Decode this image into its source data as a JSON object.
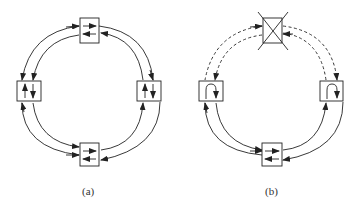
{
  "figure": {
    "panels": [
      {
        "id": "a",
        "caption": "(a)",
        "description": "Ring of four nodes with bidirectional links (dual counter-rotating ring), all links intact",
        "nodes": [
          "top",
          "right",
          "bottom",
          "left"
        ],
        "link_style": "solid"
      },
      {
        "id": "b",
        "caption": "(b)",
        "description": "Same ring with top node failed (crossed out); links to failed node dashed; left and right nodes loop back traffic",
        "nodes": [
          "top (failed)",
          "right (loopback)",
          "bottom",
          "left (loopback)"
        ],
        "link_style_failed": "dashed"
      }
    ]
  },
  "colors": {
    "stroke": "#222222",
    "background": "#ffffff"
  }
}
